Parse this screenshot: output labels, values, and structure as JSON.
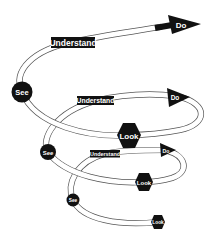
{
  "diagram": {
    "type": "spiral-cycle",
    "colors": {
      "node_fill": "#111111",
      "node_text": "#ffffff",
      "tube_stroke": "#555555",
      "background": "#ffffff"
    },
    "loops": [
      {
        "see": "See",
        "understand": "Understand",
        "do": "Do",
        "look": "Look"
      },
      {
        "see": "See",
        "understand": "Understand",
        "do": "Do",
        "look": "Look"
      },
      {
        "see": "See",
        "understand": "Understand",
        "do": "Do",
        "look": "Look"
      }
    ],
    "top": {
      "understand": "Understand",
      "do": "Do"
    }
  }
}
